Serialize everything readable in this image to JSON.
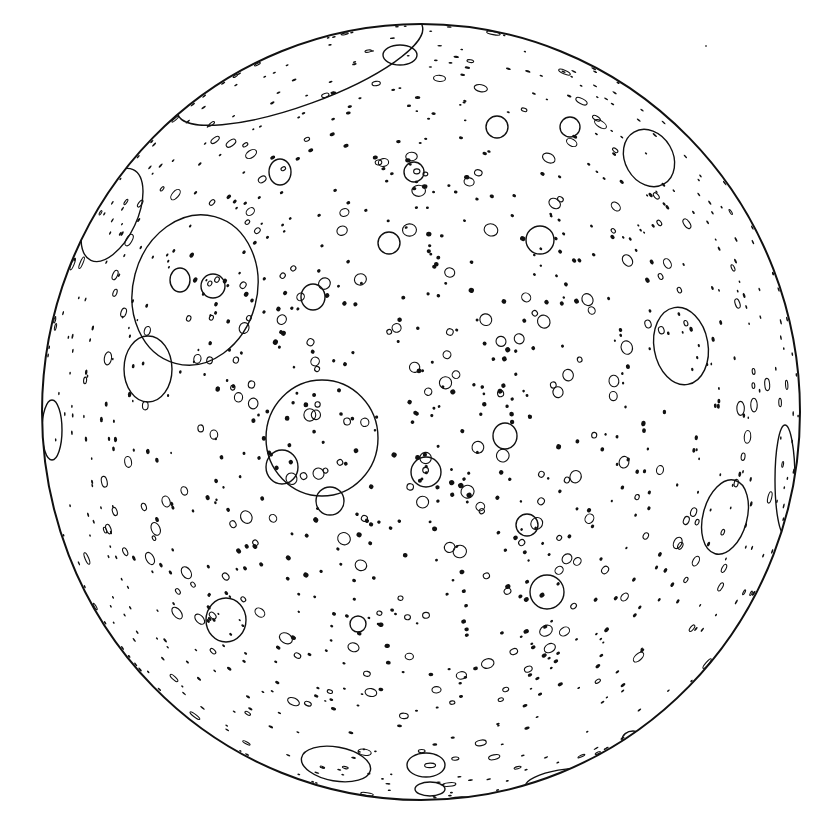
{
  "figure": {
    "background": "#ffffff",
    "ink": "#111111",
    "stray_dot": {
      "cx": 706,
      "cy": 46,
      "r": 1
    }
  },
  "sphere": {
    "cx": 421,
    "cy": 412,
    "rx": 379,
    "ry": 388,
    "stroke_width": 2
  },
  "large_craters": [
    {
      "name": "north-limb-basin",
      "cx": 300,
      "cy": 70,
      "rx": 130,
      "ry": 35,
      "rot": -20
    },
    {
      "name": "north-pole-crater",
      "cx": 400,
      "cy": 55,
      "rx": 17,
      "ry": 10,
      "rot": 0
    },
    {
      "name": "upper-left-basin",
      "cx": 195,
      "cy": 290,
      "rx": 62,
      "ry": 76,
      "rot": 15
    },
    {
      "name": "left-basin-small",
      "cx": 148,
      "cy": 369,
      "rx": 24,
      "ry": 33,
      "rot": 0
    },
    {
      "name": "central-basin",
      "cx": 322,
      "cy": 438,
      "rx": 56,
      "ry": 58,
      "rot": 0
    },
    {
      "name": "northwest-limb-crater",
      "cx": 112,
      "cy": 215,
      "rx": 25,
      "ry": 50,
      "rot": 25
    },
    {
      "name": "northeast-crater",
      "cx": 649,
      "cy": 158,
      "rx": 24,
      "ry": 30,
      "rot": -30
    },
    {
      "name": "east-basin",
      "cx": 681,
      "cy": 346,
      "rx": 27,
      "ry": 39,
      "rot": -10
    },
    {
      "name": "southeast-basin",
      "cx": 725,
      "cy": 517,
      "rx": 22,
      "ry": 38,
      "rot": 15
    },
    {
      "name": "east-limb-crater",
      "cx": 785,
      "cy": 480,
      "rx": 10,
      "ry": 55,
      "rot": 0
    },
    {
      "name": "west-limb-crater",
      "cx": 52,
      "cy": 430,
      "rx": 10,
      "ry": 30,
      "rot": 0
    },
    {
      "name": "south-crater-1",
      "cx": 336,
      "cy": 764,
      "rx": 35,
      "ry": 17,
      "rot": 10
    },
    {
      "name": "south-crater-2",
      "cx": 426,
      "cy": 765,
      "rx": 19,
      "ry": 12,
      "rot": 0
    },
    {
      "name": "south-crater-3",
      "cx": 430,
      "cy": 789,
      "rx": 15,
      "ry": 7,
      "rot": 0
    },
    {
      "name": "south-crater-4",
      "cx": 462,
      "cy": 803,
      "rx": 18,
      "ry": 6,
      "rot": 0
    },
    {
      "name": "southeast-limb-crater",
      "cx": 560,
      "cy": 780,
      "rx": 35,
      "ry": 10,
      "rot": -10
    },
    {
      "name": "mid-crater-a",
      "cx": 547,
      "cy": 592,
      "rx": 17,
      "ry": 17,
      "rot": 0
    },
    {
      "name": "mid-crater-b",
      "cx": 226,
      "cy": 620,
      "rx": 20,
      "ry": 22,
      "rot": 0
    },
    {
      "name": "mid-crater-c",
      "cx": 540,
      "cy": 240,
      "rx": 14,
      "ry": 14,
      "rot": 0
    },
    {
      "name": "mid-crater-d",
      "cx": 330,
      "cy": 501,
      "rx": 14,
      "ry": 14,
      "rot": 0
    },
    {
      "name": "mid-crater-e",
      "cx": 282,
      "cy": 467,
      "rx": 16,
      "ry": 17,
      "rot": 0
    },
    {
      "name": "mid-crater-f",
      "cx": 426,
      "cy": 472,
      "rx": 15,
      "ry": 15,
      "rot": 0
    },
    {
      "name": "mid-crater-g",
      "cx": 505,
      "cy": 436,
      "rx": 12,
      "ry": 13,
      "rot": 0
    },
    {
      "name": "mid-crater-h",
      "cx": 180,
      "cy": 280,
      "rx": 10,
      "ry": 12,
      "rot": 0
    },
    {
      "name": "mid-crater-i",
      "cx": 213,
      "cy": 286,
      "rx": 12,
      "ry": 12,
      "rot": 0
    },
    {
      "name": "mid-crater-j",
      "cx": 313,
      "cy": 297,
      "rx": 12,
      "ry": 13,
      "rot": 0
    },
    {
      "name": "mid-crater-k",
      "cx": 280,
      "cy": 172,
      "rx": 11,
      "ry": 13,
      "rot": 0
    },
    {
      "name": "mid-crater-l",
      "cx": 414,
      "cy": 172,
      "rx": 10,
      "ry": 10,
      "rot": 0
    },
    {
      "name": "mid-crater-m",
      "cx": 389,
      "cy": 243,
      "rx": 11,
      "ry": 11,
      "rot": 0
    },
    {
      "name": "mid-crater-n",
      "cx": 527,
      "cy": 525,
      "rx": 11,
      "ry": 11,
      "rot": 0
    },
    {
      "name": "mid-crater-o",
      "cx": 497,
      "cy": 127,
      "rx": 11,
      "ry": 11,
      "rot": 0
    },
    {
      "name": "mid-crater-p",
      "cx": 570,
      "cy": 127,
      "rx": 10,
      "ry": 10,
      "rot": 0
    },
    {
      "name": "mid-crater-q",
      "cx": 358,
      "cy": 624,
      "rx": 8,
      "ry": 8,
      "rot": 0
    },
    {
      "name": "mid-crater-r",
      "cx": 633,
      "cy": 740,
      "rx": 11,
      "ry": 9,
      "rot": 0
    }
  ],
  "small_crater_field": {
    "count": 1100,
    "seed": 1337,
    "ring_fraction": 0.55,
    "min_r": 1.5,
    "max_r": 7
  }
}
